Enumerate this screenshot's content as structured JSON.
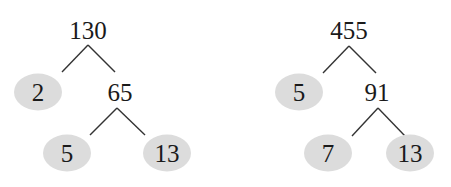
{
  "trees": [
    {
      "root": "130",
      "prime_left": "2",
      "composite": "65",
      "leaf_left": "5",
      "leaf_right": "13"
    },
    {
      "root": "455",
      "prime_left": "5",
      "composite": "91",
      "leaf_left": "7",
      "leaf_right": "13"
    }
  ],
  "colors": {
    "prime_fill": "#dcdcdc",
    "line": "#333333",
    "text": "#1a1a1a"
  }
}
